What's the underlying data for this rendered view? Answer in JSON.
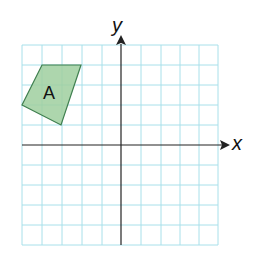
{
  "axes": {
    "x_label": "x",
    "y_label": "y"
  },
  "grid": {
    "x_min": -5,
    "x_max": 5,
    "y_min": -5,
    "y_max": 5,
    "color": "#a8e0ea"
  },
  "shape": {
    "label": "A",
    "fill": "#9fcf9f",
    "stroke": "#3f7f4f",
    "vertices": [
      [
        -4,
        4
      ],
      [
        -2,
        4
      ],
      [
        -3,
        1
      ],
      [
        -5,
        2
      ]
    ]
  }
}
